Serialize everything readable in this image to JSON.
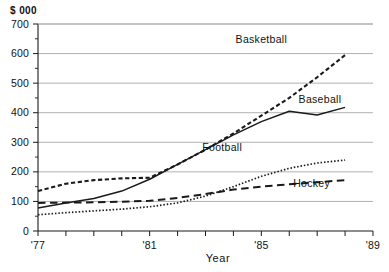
{
  "chart_data": {
    "type": "line",
    "title": "",
    "xlabel": "Year",
    "ylabel": "$ 000",
    "unit_label": "$ 000",
    "grid": true,
    "legend_position": "inline-right",
    "xlim": [
      1977,
      1989
    ],
    "ylim": [
      0,
      700
    ],
    "ytick_labels": [
      "0",
      "100",
      "200",
      "300",
      "400",
      "500",
      "600",
      "700"
    ],
    "ytick_values": [
      0,
      100,
      200,
      300,
      400,
      500,
      600,
      700
    ],
    "yminor_values": [
      50,
      150,
      250,
      350,
      450,
      550,
      650
    ],
    "xtick_values": [
      1977,
      1978,
      1979,
      1980,
      1981,
      1982,
      1983,
      1984,
      1985,
      1986,
      1987,
      1988,
      1989
    ],
    "xtick_labels": [
      "'77",
      "",
      "",
      "",
      "'81",
      "",
      "",
      "",
      "'85",
      "",
      "",
      "",
      "'89"
    ],
    "x": [
      1977,
      1978,
      1979,
      1980,
      1981,
      1982,
      1983,
      1984,
      1985,
      1986,
      1987,
      1988
    ],
    "series": [
      {
        "name": "Basketball",
        "line_style": "dashed-thick",
        "label": "Basketball",
        "values": [
          135,
          160,
          172,
          178,
          180,
          225,
          275,
          330,
          390,
          450,
          520,
          595
        ]
      },
      {
        "name": "Baseball",
        "line_style": "solid",
        "label": "Baseball",
        "values": [
          78,
          95,
          110,
          135,
          175,
          225,
          275,
          325,
          370,
          405,
          392,
          418
        ]
      },
      {
        "name": "Football",
        "line_style": "dotted-fine",
        "label": "Football",
        "values": [
          55,
          62,
          68,
          74,
          82,
          95,
          118,
          150,
          185,
          212,
          230,
          240
        ]
      },
      {
        "name": "Hockey",
        "line_style": "dashed-long",
        "label": "Hockey",
        "values": [
          95,
          96,
          97,
          99,
          102,
          112,
          125,
          140,
          150,
          158,
          165,
          172
        ]
      }
    ],
    "annotations": [
      {
        "text": "Basketball",
        "x": 1985.0,
        "y": 635
      },
      {
        "text": "Baseball",
        "x": 1987.1,
        "y": 432
      },
      {
        "text": "Football",
        "x": 1983.6,
        "y": 270
      },
      {
        "text": "Hockey",
        "x": 1986.8,
        "y": 148
      }
    ]
  },
  "colors": {
    "background": "#ffffff",
    "ink": "#1a1a1a",
    "gridline": "#a8a8a8"
  }
}
